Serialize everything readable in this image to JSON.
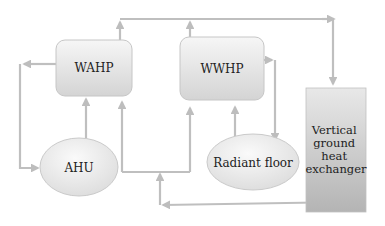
{
  "diagram": {
    "type": "flow",
    "nodes": [
      {
        "id": "wahp",
        "label": "WAHP",
        "shape": "rounded-rect"
      },
      {
        "id": "wwhp",
        "label": "WWHP",
        "shape": "rounded-rect"
      },
      {
        "id": "ahu",
        "label": "AHU",
        "shape": "ellipse"
      },
      {
        "id": "radiant",
        "label": "Radiant floor",
        "shape": "ellipse"
      },
      {
        "id": "ghe",
        "label_lines": [
          "Vertical",
          "ground",
          "heat",
          "exchanger"
        ],
        "shape": "rect"
      }
    ],
    "edges": [
      {
        "from": "wahp",
        "to": "ghe",
        "via": "top line"
      },
      {
        "from": "wwhp",
        "to": "ghe",
        "via": "top line"
      },
      {
        "from": "wahp",
        "to": "ahu",
        "via": "left loop"
      },
      {
        "from": "ahu",
        "to": "wahp"
      },
      {
        "from": "ghe",
        "to": "wahp",
        "via": "bottom return + junction"
      },
      {
        "from": "ghe",
        "to": "wwhp",
        "via": "bottom return + junction"
      },
      {
        "from": "wwhp",
        "to": "radiant"
      },
      {
        "from": "radiant",
        "to": "wwhp"
      }
    ],
    "colors": {
      "line": "#bdbdbd",
      "box_fill_top": "#f4f4f4",
      "box_fill_bottom": "#d6d6d6",
      "box_stroke": "#c4c4c4",
      "ghe_fill_top": "#e6e6e6",
      "ghe_fill_bottom": "#b5b5b5"
    }
  }
}
